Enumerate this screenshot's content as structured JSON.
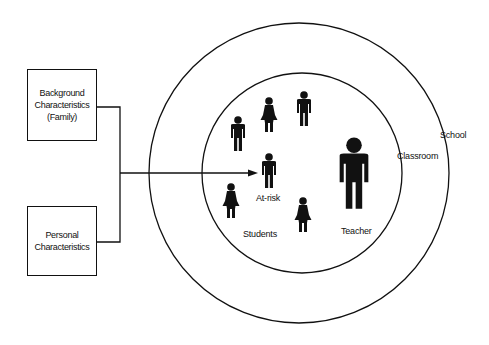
{
  "diagram": {
    "boxes": [
      {
        "label_lines": [
          "Background",
          "Characteristics",
          "(Family)"
        ]
      },
      {
        "label_lines": [
          "Personal",
          "Characteristics"
        ]
      }
    ],
    "circles": {
      "outer": {
        "label": "School"
      },
      "inner": {
        "label": "Classroom"
      }
    },
    "figures": {
      "at_risk_label": "At-risk",
      "students_label": "Students",
      "teacher_label": "Teacher"
    },
    "colors": {
      "ink": "#111111",
      "background": "#ffffff"
    }
  }
}
